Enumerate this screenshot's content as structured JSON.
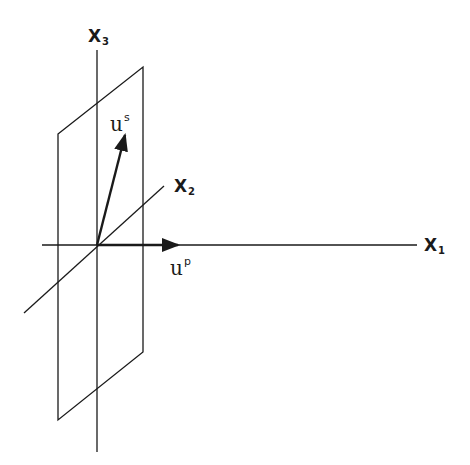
{
  "diagram": {
    "title": "",
    "colors": {
      "stroke": "#1a1a1a",
      "background": "#ffffff"
    },
    "axes": [
      {
        "id": "x1",
        "label": "X",
        "subscript": "1"
      },
      {
        "id": "x2",
        "label": "X",
        "subscript": "2"
      },
      {
        "id": "x3",
        "label": "X",
        "subscript": "3"
      }
    ],
    "vectors": [
      {
        "id": "up",
        "label": "u",
        "superscript": "p",
        "direction": "along X1"
      },
      {
        "id": "us",
        "label": "u",
        "superscript": "s",
        "direction": "in plane, near X3"
      }
    ],
    "plane": {
      "description": "parallelogram plane containing X2 and X3 axes"
    }
  }
}
